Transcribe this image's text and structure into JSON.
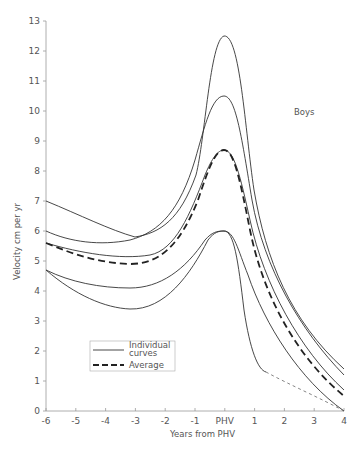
{
  "chart_data": {
    "type": "line",
    "title": "",
    "annotation": "Boys",
    "xlabel": "Years from PHV",
    "ylabel": "Velocity cm per yr",
    "xlim": [
      -6,
      4
    ],
    "ylim": [
      0,
      13
    ],
    "grid": false,
    "legend_position": "lower-left",
    "x_ticks": [
      "-6",
      "-5",
      "-4",
      "-3",
      "-2",
      "-1",
      "PHV",
      "1",
      "2",
      "3",
      "4"
    ],
    "y_ticks": [
      "0",
      "1",
      "2",
      "3",
      "4",
      "5",
      "6",
      "7",
      "8",
      "9",
      "10",
      "11",
      "12",
      "13"
    ],
    "x": [
      -6,
      -5,
      -4,
      -3,
      -2,
      -1,
      0,
      1,
      2,
      3,
      4
    ],
    "series": [
      {
        "name": "Individual curve 1",
        "style": "solid",
        "values": [
          7.0,
          6.6,
          6.2,
          5.8,
          6.3,
          8.5,
          12.5,
          7.0,
          3.8,
          2.3,
          1.4
        ]
      },
      {
        "name": "Individual curve 2",
        "style": "solid",
        "values": [
          6.0,
          5.6,
          5.5,
          5.7,
          6.4,
          8.0,
          10.5,
          6.5,
          3.6,
          2.2,
          1.2
        ]
      },
      {
        "name": "Individual curve 3",
        "style": "solid",
        "values": [
          5.6,
          5.3,
          5.2,
          5.1,
          5.4,
          6.8,
          8.7,
          5.5,
          3.0,
          1.6,
          0.7
        ]
      },
      {
        "name": "Individual curve 4",
        "style": "solid",
        "values": [
          4.7,
          4.3,
          4.1,
          4.1,
          4.3,
          5.2,
          6.0,
          4.5,
          2.6,
          1.1,
          0.0
        ]
      },
      {
        "name": "Individual curve 5",
        "style": "solid",
        "values": [
          4.7,
          3.9,
          3.5,
          3.4,
          3.6,
          4.8,
          6.0,
          3.0,
          1.3,
          0.6,
          0.0
        ]
      },
      {
        "name": "Average",
        "style": "dashed",
        "values": [
          5.6,
          5.1,
          4.9,
          4.9,
          5.1,
          6.6,
          8.7,
          5.3,
          2.8,
          1.5,
          0.5
        ]
      }
    ],
    "legend": [
      {
        "label": "Individual curves",
        "style": "solid"
      },
      {
        "label": "Average",
        "style": "dashed"
      }
    ]
  },
  "labels": {
    "annotation": "Boys",
    "xlabel": "Years from PHV",
    "ylabel": "Velocity cm per yr",
    "legend_individual": "Individual",
    "legend_individual_2": "curves",
    "legend_average": "Average"
  }
}
